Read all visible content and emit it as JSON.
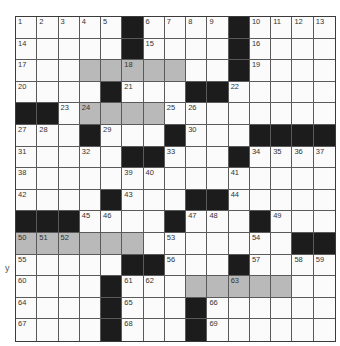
{
  "puzzle": {
    "rows": 15,
    "cols": 15,
    "colors": {
      "black": "#1c1c1c",
      "gray": "#b9b9b9",
      "white": "#fbfbfb",
      "lines": "#5a5a5a"
    },
    "legend": "# = black square, g = shaded square, . = white square; numbers are clue numbers",
    "grid": [
      [
        "1",
        "2",
        "3",
        "4",
        "5",
        "#",
        "6",
        "7",
        "8",
        "9",
        "#",
        "10",
        "11",
        "12",
        "13"
      ],
      [
        "14",
        ".",
        ".",
        ".",
        ".",
        "#",
        "15",
        ".",
        ".",
        ".",
        "#",
        "16",
        ".",
        ".",
        "."
      ],
      [
        "17",
        ".",
        ".",
        "g",
        "g",
        "g18",
        "g",
        "g",
        ".",
        ".",
        "#",
        "19",
        ".",
        ".",
        "."
      ],
      [
        "20",
        ".",
        ".",
        ".",
        "#",
        "21",
        ".",
        ".",
        "#",
        "#",
        "22",
        ".",
        ".",
        ".",
        "."
      ],
      [
        "#",
        "#",
        "23",
        "g24",
        "g",
        "g",
        "g",
        "25",
        "26",
        ".",
        ".",
        ".",
        ".",
        ".",
        "."
      ],
      [
        "27",
        "28",
        ".",
        "#",
        "29",
        ".",
        ".",
        "#",
        "30",
        ".",
        ".",
        "#",
        "#",
        "#",
        "#"
      ],
      [
        "31",
        ".",
        ".",
        "32",
        ".",
        "#",
        "#",
        "33",
        ".",
        ".",
        "#",
        "34",
        "35",
        "36",
        "37"
      ],
      [
        "38",
        ".",
        ".",
        ".",
        ".",
        "39",
        "40",
        ".",
        ".",
        ".",
        "41",
        ".",
        ".",
        ".",
        "."
      ],
      [
        "42",
        ".",
        ".",
        ".",
        "#",
        "43",
        ".",
        ".",
        "#",
        "#",
        "44",
        ".",
        ".",
        ".",
        "."
      ],
      [
        "#",
        "#",
        "#",
        "45",
        "46",
        ".",
        ".",
        "#",
        "47",
        "48",
        ".",
        "#",
        "49",
        ".",
        "."
      ],
      [
        "g50",
        "g51",
        "g52",
        "g",
        "g",
        "g",
        ".",
        "53",
        ".",
        ".",
        ".",
        "54",
        ".",
        "#",
        "#"
      ],
      [
        "55",
        ".",
        ".",
        ".",
        ".",
        "#",
        "#",
        "56",
        ".",
        ".",
        "#",
        "57",
        ".",
        "58",
        "59"
      ],
      [
        "60",
        ".",
        ".",
        ".",
        "#",
        "61",
        "62",
        ".",
        "g",
        "g",
        "g63",
        "g",
        "g",
        ".",
        "."
      ],
      [
        "64",
        ".",
        ".",
        ".",
        "#",
        "65",
        ".",
        ".",
        "#",
        "66",
        ".",
        ".",
        ".",
        ".",
        "."
      ],
      [
        "67",
        ".",
        ".",
        ".",
        "#",
        "68",
        ".",
        ".",
        "#",
        "69",
        ".",
        ".",
        ".",
        ".",
        "."
      ]
    ]
  },
  "margin_mark": "y"
}
